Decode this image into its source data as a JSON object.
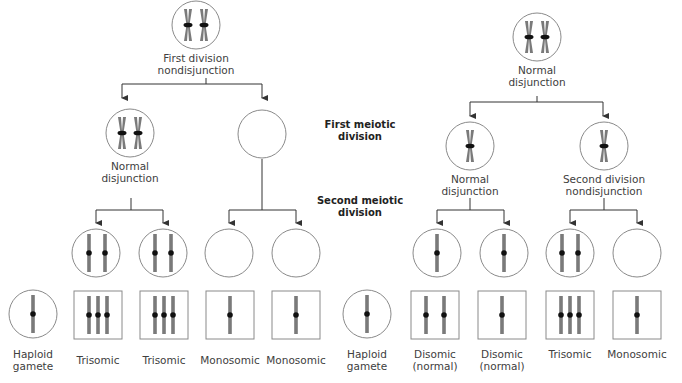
{
  "section_labels": {
    "first_meiotic_line1": "First meiotic",
    "first_meiotic_line2": "division",
    "second_meiotic_line1": "Second meiotic",
    "second_meiotic_line2": "division"
  },
  "left_tree": {
    "root_label_line1": "First division",
    "root_label_line2": "nondisjunction",
    "mid_left_label_line1": "Normal",
    "mid_left_label_line2": "disjunction"
  },
  "right_tree": {
    "root_label_line1": "Normal",
    "root_label_line2": "disjunction",
    "mid_left_label_line1": "Normal",
    "mid_left_label_line2": "disjunction",
    "mid_right_label_line1": "Second division",
    "mid_right_label_line2": "nondisjunction"
  },
  "results": [
    {
      "line1": "Haploid",
      "line2": "gamete",
      "chromosomes": 1,
      "shape": "circle"
    },
    {
      "line1": "Trisomic",
      "line2": "",
      "chromosomes": 3,
      "shape": "square"
    },
    {
      "line1": "Trisomic",
      "line2": "",
      "chromosomes": 3,
      "shape": "square"
    },
    {
      "line1": "Monosomic",
      "line2": "",
      "chromosomes": 1,
      "shape": "square"
    },
    {
      "line1": "Monosomic",
      "line2": "",
      "chromosomes": 1,
      "shape": "square"
    },
    {
      "line1": "Haploid",
      "line2": "gamete",
      "chromosomes": 1,
      "shape": "circle"
    },
    {
      "line1": "Disomic",
      "line2": "(normal)",
      "chromosomes": 2,
      "shape": "square"
    },
    {
      "line1": "Disomic",
      "line2": "(normal)",
      "chromosomes": 2,
      "shape": "square"
    },
    {
      "line1": "Trisomic",
      "line2": "",
      "chromosomes": 3,
      "shape": "square"
    },
    {
      "line1": "Monosomic",
      "line2": "",
      "chromosomes": 1,
      "shape": "square"
    }
  ],
  "colors": {
    "chromosome": "#7a7a7a",
    "centromere": "#111111",
    "outline": "#8a8a8a",
    "arrow": "#333333"
  }
}
